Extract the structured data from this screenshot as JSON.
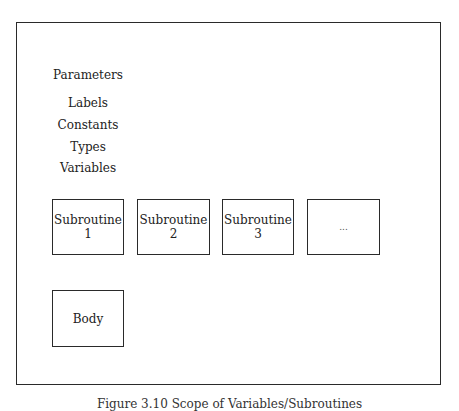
{
  "diagram": {
    "declarations": [
      {
        "label": "Parameters"
      },
      {
        "label": "Labels"
      },
      {
        "label": "Constants"
      },
      {
        "label": "Types"
      },
      {
        "label": "Variables"
      }
    ],
    "subroutines": [
      {
        "title": "Subroutine",
        "number": "1"
      },
      {
        "title": "Subroutine",
        "number": "2"
      },
      {
        "title": "Subroutine",
        "number": "3"
      },
      {
        "title": "...",
        "number": ""
      }
    ],
    "body": {
      "label": "Body"
    },
    "caption": "Figure 3.10  Scope of Variables/Subroutines",
    "colors": {
      "stroke": "#2a2a2a",
      "text": "#222222",
      "background": "#ffffff"
    }
  }
}
